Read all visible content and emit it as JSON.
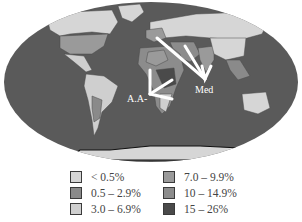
{
  "map": {
    "ocean_color": "#5a5a5a",
    "labels": [
      {
        "text": "Med",
        "x": 207,
        "y": 93
      },
      {
        "text": "A.A-",
        "x": 130,
        "y": 103
      }
    ],
    "arrows": [
      {
        "name": "med-arrow-1",
        "from": [
          157,
          38
        ],
        "to": [
          205,
          79
        ]
      },
      {
        "name": "med-arrow-2",
        "from": [
          185,
          46
        ],
        "to": [
          205,
          79
        ]
      },
      {
        "name": "aa-arrow",
        "from": [
          172,
          80
        ],
        "to": [
          150,
          95
        ]
      }
    ]
  },
  "legend": {
    "items": [
      {
        "label": "< 0.5%",
        "color": "#d6d6d6"
      },
      {
        "label": "0.5 – 2.9%",
        "color": "#8a8a8a"
      },
      {
        "label": "3.0 – 6.9%",
        "color": "#cfcfcf"
      },
      {
        "label": "7.0 – 9.9%",
        "color": "#9a9a9a"
      },
      {
        "label": "10 – 14.9%",
        "color": "#8c8c8c"
      },
      {
        "label": "15 – 26%",
        "color": "#4a4a4a"
      }
    ]
  }
}
